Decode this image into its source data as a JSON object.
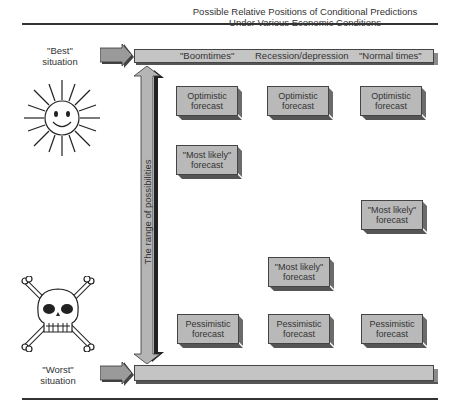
{
  "diagram": {
    "title_line1": "Possible Relative Positions of Conditional Predictions",
    "title_line2": "Under Various Economic Conditions",
    "best_label_line1": "\"Best\"",
    "best_label_line2": "situation",
    "worst_label_line1": "\"Worst\"",
    "worst_label_line2": "situation",
    "axis_label": "The range of possibilities",
    "best_icon": "smiling-sun-icon",
    "worst_icon": "skull-crossbones-icon",
    "columns": [
      "\"Boomtimes\"",
      "Recession/depression",
      "\"Normal times\""
    ],
    "boxes": {
      "optimistic": [
        "Optimistic",
        "forecast"
      ],
      "most_likely": [
        "\"Most likely\"",
        "forecast"
      ],
      "pessimistic": [
        "Pessimistic",
        "forecast"
      ]
    },
    "colors": {
      "box_fill": "#b9b9b9",
      "bar_fill": "#c4c4c4",
      "shadow": "#555555",
      "rule": "#333333"
    }
  }
}
